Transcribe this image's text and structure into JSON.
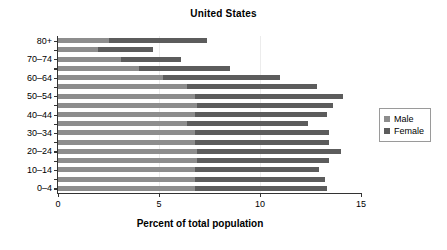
{
  "chart_data": {
    "type": "bar",
    "orientation": "horizontal",
    "stacked": true,
    "title": "United States",
    "xlabel": "Percent of total population",
    "ylabel": "",
    "xlim": [
      0,
      15
    ],
    "xticks": [
      0,
      5,
      10,
      15
    ],
    "xtick_labels": [
      "0",
      "5",
      "10",
      "15"
    ],
    "grid": true,
    "legend_position": "right",
    "categories": [
      "0–4",
      "5–9",
      "10–14",
      "15–19",
      "20–24",
      "25–29",
      "30–34",
      "35–39",
      "40–44",
      "45–49",
      "50–54",
      "55–59",
      "60–64",
      "65–69",
      "70–74",
      "75–79",
      "80+"
    ],
    "visible_ytick_labels": [
      "0–4",
      "10–14",
      "20–24",
      "30–34",
      "40–44",
      "50–54",
      "60–64",
      "70–74",
      "80+"
    ],
    "series": [
      {
        "name": "Male",
        "color": "#8d8d8d",
        "values": [
          6.8,
          6.8,
          6.8,
          6.9,
          6.9,
          6.8,
          6.8,
          6.4,
          6.8,
          6.9,
          6.8,
          6.4,
          5.2,
          4.0,
          3.1,
          2.0,
          2.5
        ]
      },
      {
        "name": "Female",
        "color": "#5c5c5c",
        "values": [
          6.5,
          6.4,
          6.1,
          6.5,
          7.1,
          6.6,
          6.6,
          6.0,
          6.5,
          6.7,
          7.3,
          6.4,
          5.8,
          4.5,
          3.0,
          2.7,
          4.9
        ]
      }
    ],
    "totals": [
      13.3,
      13.2,
      12.9,
      13.4,
      14.0,
      13.4,
      13.4,
      12.4,
      13.3,
      13.6,
      14.1,
      12.8,
      11.0,
      8.5,
      6.1,
      4.7,
      7.4
    ]
  },
  "legend": {
    "items": [
      {
        "label": "Male",
        "color": "#8d8d8d"
      },
      {
        "label": "Female",
        "color": "#5c5c5c"
      }
    ]
  }
}
